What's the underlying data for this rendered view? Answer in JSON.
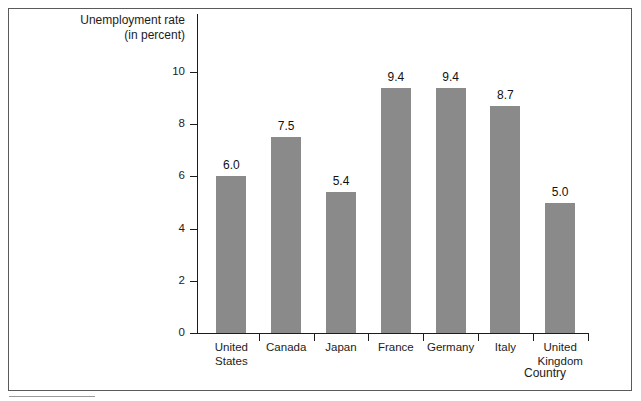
{
  "chart_data": {
    "type": "bar",
    "title": "",
    "ylabel_line1": "Unemployment rate",
    "ylabel_line2": "(in percent)",
    "xlabel": "Country",
    "categories": [
      "United States",
      "Canada",
      "Japan",
      "France",
      "Germany",
      "Italy",
      "United Kingdom"
    ],
    "category_lines": [
      [
        "United",
        "States"
      ],
      [
        "Canada",
        ""
      ],
      [
        "Japan",
        ""
      ],
      [
        "France",
        ""
      ],
      [
        "Germany",
        ""
      ],
      [
        "Italy",
        ""
      ],
      [
        "United",
        "Kingdom"
      ]
    ],
    "values": [
      6.0,
      7.5,
      5.4,
      9.4,
      9.4,
      8.7,
      5.0
    ],
    "value_labels": [
      "6.0",
      "7.5",
      "5.4",
      "9.4",
      "9.4",
      "8.7",
      "5.0"
    ],
    "yticks": [
      0,
      2,
      4,
      6,
      8,
      10
    ],
    "ytick_labels": [
      "0",
      "2",
      "4",
      "6",
      "8",
      "10"
    ],
    "ylim": [
      0,
      10.3
    ],
    "grid": false,
    "legend": null,
    "bar_color": "#8a8a8a",
    "axis_color": "#1c1c1c",
    "frame_color": "#5a5a5a",
    "background": "#ffffff"
  }
}
